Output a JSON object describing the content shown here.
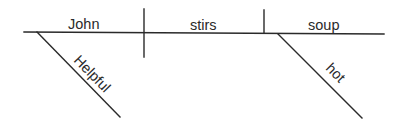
{
  "diagram": {
    "type": "sentence-diagram (Reed-Kellogg)",
    "sentence_words": [
      "John",
      "stirs",
      "soup",
      "Helpful",
      "hot"
    ],
    "colors": {
      "line": "#2a2a2a",
      "text": "#2a2a2a",
      "background": "#ffffff"
    },
    "baseline": {
      "subject": "John",
      "verb": "stirs",
      "object": "soup"
    },
    "modifiers": {
      "subject_modifier": "Helpful",
      "object_modifier": "hot"
    }
  }
}
